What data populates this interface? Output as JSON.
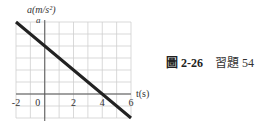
{
  "chart_data": {
    "type": "line",
    "title": "",
    "xlabel": "t(s)",
    "ylabel": "a(m/s²)",
    "y_marker_label": "a",
    "x_ticks": [
      -2,
      0,
      2,
      4,
      6
    ],
    "x_tick_labels": [
      "-2",
      "0",
      "2",
      "4",
      "6"
    ],
    "xlim": [
      -2,
      6
    ],
    "ylim_grid_units": [
      -2,
      6
    ],
    "grid": true,
    "series": [
      {
        "name": "acceleration",
        "x": [
          -2,
          0,
          4,
          6
        ],
        "y_grid_units": [
          6,
          4,
          0,
          -2
        ]
      }
    ],
    "annotations": [
      "y value at top gridline marked 'a' (unscaled)"
    ]
  },
  "caption": {
    "figure_label": "圖 2-26",
    "exercise_label": "習題 54"
  }
}
